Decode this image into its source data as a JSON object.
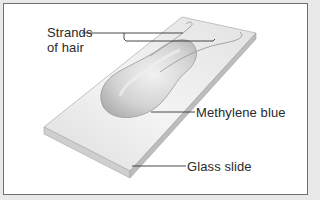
{
  "figure": {
    "type": "illustration",
    "labels": [
      {
        "id": "strands",
        "line1": "Strands",
        "line2": "of hair"
      },
      {
        "id": "stain",
        "text": "Methylene blue"
      },
      {
        "id": "slide",
        "text": "Glass slide"
      }
    ],
    "colors": {
      "frame_border": "#6f6f6f",
      "background": "#ffffff",
      "margin": "#e9e9e9",
      "leader_line": "#333333",
      "slide_top": "#ececec",
      "slide_edge": "#c9c9c9",
      "drop": "#d4d4d4"
    }
  }
}
